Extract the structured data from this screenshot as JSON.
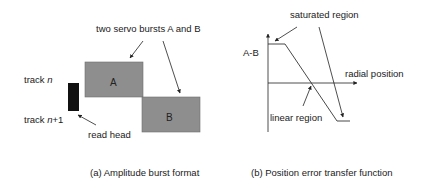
{
  "panel_a": {
    "title": "two servo bursts A and B",
    "burst_a_label": "A",
    "burst_b_label": "B",
    "track_n_prefix": "track ",
    "track_n_var": "n",
    "track_n1_prefix": "track ",
    "track_n1_var": "n",
    "track_n1_suffix": "+1",
    "read_head_label": "read head",
    "caption": "(a) Amplitude burst format",
    "burst_color": "#8e8e8e",
    "head_color": "#111111"
  },
  "panel_b": {
    "y_axis_label": "A-B",
    "x_axis_label": "radial position",
    "saturated_label": "saturated region",
    "linear_label": "linear region",
    "caption": "(b)  Position error transfer function"
  }
}
